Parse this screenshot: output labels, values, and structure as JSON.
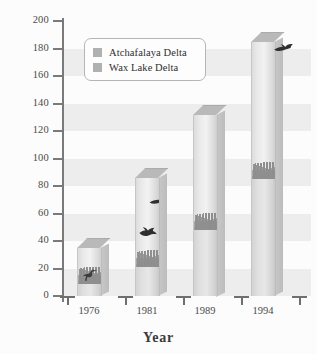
{
  "chart_data": {
    "type": "bar",
    "title": "",
    "xlabel": "Year",
    "ylabel": "Area  (km2)",
    "ylabel_text": "Area  (km",
    "ylabel_sup": "2",
    "ylabel_close": ")",
    "categories": [
      "1976",
      "1981",
      "1989",
      "1994"
    ],
    "ylim": [
      0,
      200
    ],
    "yticks": [
      0,
      20,
      40,
      60,
      80,
      100,
      120,
      140,
      160,
      180,
      200
    ],
    "ytick_labels": [
      "0",
      "20",
      "40",
      "60",
      "80",
      "100",
      "120",
      "140",
      "160",
      "180",
      "200"
    ],
    "grid": "horizontal-bands",
    "legend_position": "upper-left-inside",
    "stacked": true,
    "series": [
      {
        "name": "Wax Lake Delta",
        "color": "#b0b0b0",
        "values": [
          9,
          21,
          48,
          85
        ]
      },
      {
        "name": "Atchafalaya Delta",
        "color": "#d9d9d9",
        "values": [
          26,
          65,
          84,
          100
        ]
      }
    ],
    "totals": [
      35,
      86,
      132,
      185
    ],
    "annotations": [
      {
        "name": "wading-bird-1976",
        "year": "1976",
        "approx_y": 15
      },
      {
        "name": "flying-duck-1981",
        "year": "1981",
        "approx_y": 45
      },
      {
        "name": "flying-bird-1981-upper",
        "year": "1981",
        "approx_y": 69
      },
      {
        "name": "flying-bird-1994",
        "year": "1994",
        "approx_y": 176
      }
    ]
  },
  "legend": {
    "items": [
      {
        "label": "Atchafalaya Delta",
        "color": "#b0b0b0"
      },
      {
        "label": "Wax Lake Delta",
        "color": "#b0b0b0"
      }
    ]
  },
  "axes": {
    "y_title_main": "Area  (km",
    "y_title_sup": "2",
    "y_title_tail": ")",
    "x_title": "Year"
  },
  "colors": {
    "background": "#fcfcfc",
    "band": "#ededed",
    "axis": "#7a7a7a",
    "bar_light": "#e7e7e7",
    "bar_dark": "#b9b9b9",
    "text": "#3a3a3a"
  }
}
